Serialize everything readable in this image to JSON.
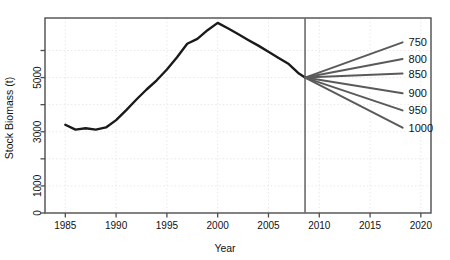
{
  "chart_data": {
    "type": "line",
    "title": "",
    "xlabel": "Year",
    "ylabel": "Stock Biomass (t)",
    "xlim": [
      1983.0,
      2021.0
    ],
    "ylim": [
      0,
      7200
    ],
    "grid": true,
    "legend_position": "right-inside",
    "x_ticks": [
      1985,
      1990,
      1995,
      2000,
      2005,
      2010,
      2015,
      2020
    ],
    "x_tick_labels": [
      "1985",
      "1990",
      "1995",
      "2000",
      "2005",
      "2010",
      "2015",
      "2020"
    ],
    "y_ticks": [
      0,
      1000,
      2000,
      3000,
      4000,
      5000,
      6000
    ],
    "y_tick_labels": [
      "0",
      "1000",
      "",
      "3000",
      "",
      "5000",
      ""
    ],
    "annotations": [
      {
        "name": "projection-divider",
        "type": "vline",
        "x": 2008.6
      }
    ],
    "series": [
      {
        "name": "historical-biomass",
        "type": "line",
        "color": "#1a1a1a",
        "width": 2.4,
        "x": [
          1985,
          1986,
          1987,
          1988,
          1989,
          1990,
          1991,
          1992,
          1993,
          1994,
          1995,
          1996,
          1997,
          1998,
          1999,
          2000,
          2001,
          2002,
          2003,
          2004,
          2005,
          2006,
          2007,
          2008,
          2008.6
        ],
        "values": [
          3260,
          3080,
          3130,
          3080,
          3160,
          3430,
          3800,
          4190,
          4560,
          4900,
          5300,
          5750,
          6250,
          6430,
          6750,
          7020,
          6820,
          6610,
          6390,
          6180,
          5950,
          5720,
          5500,
          5150,
          5000
        ]
      },
      {
        "name": "projection-750",
        "type": "line",
        "color": "#5a5a5a",
        "width": 2.0,
        "label": "750",
        "x": [
          2008.6,
          2018.2
        ],
        "values": [
          5000,
          6300
        ]
      },
      {
        "name": "projection-800",
        "type": "line",
        "color": "#5a5a5a",
        "width": 2.0,
        "label": "800",
        "x": [
          2008.6,
          2018.2
        ],
        "values": [
          5000,
          5690
        ]
      },
      {
        "name": "projection-850",
        "type": "line",
        "color": "#5a5a5a",
        "width": 2.0,
        "label": "850",
        "x": [
          2008.6,
          2018.2
        ],
        "values": [
          5000,
          5150
        ]
      },
      {
        "name": "projection-900",
        "type": "line",
        "color": "#5a5a5a",
        "width": 2.0,
        "label": "900",
        "x": [
          2008.6,
          2018.2
        ],
        "values": [
          5000,
          4420
        ]
      },
      {
        "name": "projection-950",
        "type": "line",
        "color": "#5a5a5a",
        "width": 2.0,
        "label": "950",
        "x": [
          2008.6,
          2018.2
        ],
        "values": [
          5000,
          3790
        ]
      },
      {
        "name": "projection-1000",
        "type": "line",
        "color": "#5a5a5a",
        "width": 2.0,
        "label": "1000",
        "x": [
          2008.6,
          2018.2
        ],
        "values": [
          5000,
          3150
        ]
      }
    ],
    "legend_entries": [
      {
        "label": "750",
        "value": 750
      },
      {
        "label": "800",
        "value": 800
      },
      {
        "label": "850",
        "value": 850
      },
      {
        "label": "900",
        "value": 900
      },
      {
        "label": "950",
        "value": 950
      },
      {
        "label": "1000",
        "value": 1000
      }
    ],
    "colors": {
      "historical": "#1a1a1a",
      "projection": "#5a5a5a",
      "axis": "#4d4d4d",
      "grid": "#e8e8e8",
      "text": "#111111",
      "background": "#ffffff"
    }
  }
}
